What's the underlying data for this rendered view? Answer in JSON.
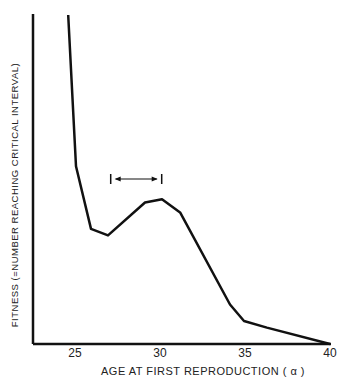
{
  "chart_data": {
    "type": "line",
    "title": "",
    "xlabel": "AGE AT FIRST REPRODUCTION (α)",
    "ylabel": "FITNESS (=NUMBER REACHING CRITICAL INTERVAL)",
    "x_ticks": [
      "25",
      "30",
      "35",
      "40"
    ],
    "xlim": [
      22.5,
      40
    ],
    "ylim": [
      0,
      1
    ],
    "y_ticks": [],
    "grid": false,
    "legend": null,
    "series": [
      {
        "name": "fitness",
        "x": [
          24.6,
          25.06,
          25.94,
          26.94,
          29.12,
          30.12,
          31.18,
          34.12,
          34.94,
          36.29,
          40
        ],
        "y": [
          1.0,
          0.54,
          0.35,
          0.33,
          0.43,
          0.44,
          0.4,
          0.12,
          0.07,
          0.05,
          0.0
        ]
      }
    ],
    "annotations": [
      {
        "type": "interval-arrow",
        "x_start": 27.1,
        "x_end": 30.1,
        "y": 0.52
      }
    ]
  },
  "labels": {
    "xlabel": "AGE AT FIRST REPRODUCTION ( α )",
    "ylabel": "FITNESS (=NUMBER REACHING CRITICAL INTERVAL)",
    "ticks": [
      "25",
      "30",
      "35",
      "40"
    ]
  }
}
